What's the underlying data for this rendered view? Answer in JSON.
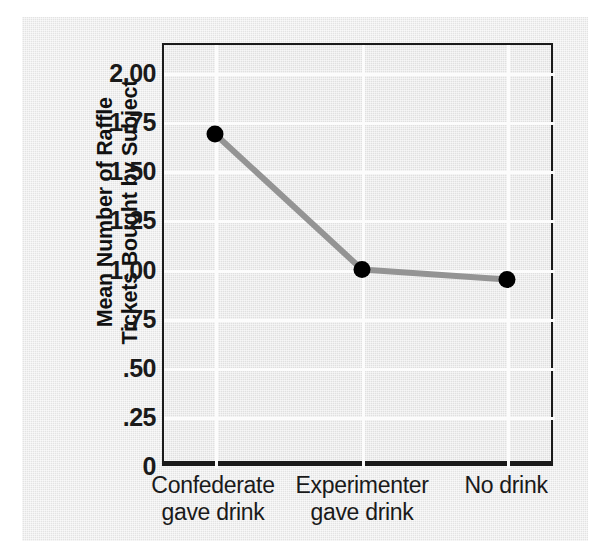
{
  "chart_data": {
    "type": "line",
    "title": "",
    "xlabel": "",
    "ylabel": "Mean Number of Raffle Tickets Bought by Subject",
    "ylabel_lines": [
      "Mean Number of Raffle",
      "Tickets Bought by Subject"
    ],
    "categories": [
      "Confederate gave drink",
      "Experimenter gave drink",
      "No drink"
    ],
    "category_lines": [
      [
        "Confederate",
        "gave drink"
      ],
      [
        "Experimenter",
        "gave drink"
      ],
      [
        "No drink"
      ]
    ],
    "values": [
      1.7,
      1.01,
      0.96
    ],
    "ylim": [
      0,
      2.0
    ],
    "ytick_values": [
      2.0,
      1.75,
      1.5,
      1.25,
      1.0,
      0.75,
      0.5,
      0.25,
      0
    ],
    "ytick_labels": [
      "2.00",
      "1.75",
      "1.50",
      "1.25",
      "1.00",
      ".75",
      ".50",
      ".25",
      "0"
    ],
    "grid": true,
    "grid_color": "#fcfcfc",
    "legend": false,
    "marker": "filled-circle",
    "marker_color": "#000000",
    "line_color": "#949494",
    "panel_color": "#e3e3e3",
    "frame_color": "#1a1a1a"
  }
}
